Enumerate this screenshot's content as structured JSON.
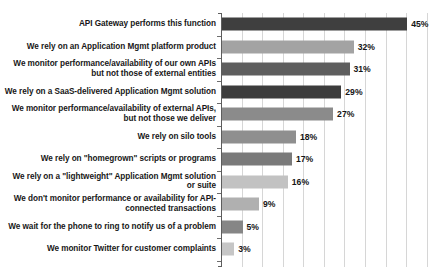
{
  "title_sliver": "",
  "chart_data": {
    "type": "bar",
    "orientation": "horizontal",
    "title": "",
    "xlabel": "",
    "ylabel": "",
    "xlim": [
      0,
      52
    ],
    "grid": true,
    "gridline_step": 5,
    "legend": "none",
    "value_suffix": "%",
    "categories": [
      "API Gateway performs this function",
      "We rely on an Application Mgmt platform product",
      "We monitor performance/availability of our own APIs but not those of external entities",
      "We rely on a  SaaS-delivered Application Mgmt solution",
      "We monitor performance/availability of external APIs, but not those we deliver",
      "We rely on silo tools",
      "We rely on \"homegrown\" scripts or programs",
      "We rely on a \"lightweight\" Application Mgmt solution or suite",
      "We don't monitor performance or availability for API-connected transactions",
      "We wait for the phone to ring to notify us of a problem",
      "We monitor Twitter for customer complaints"
    ],
    "values": [
      45,
      32,
      31,
      29,
      27,
      18,
      17,
      16,
      9,
      5,
      3
    ],
    "value_labels": [
      "45%",
      "32%",
      "31%",
      "29%",
      "27%",
      "18%",
      "17%",
      "16%",
      "9%",
      "5%",
      "3%"
    ],
    "bar_colors": [
      "#3f3f3f",
      "#a3a3a3",
      "#5e5e5e",
      "#3c3c3c",
      "#8b8b8b",
      "#8f8f8f",
      "#7a7a7a",
      "#c2c2c2",
      "#b0b0b0",
      "#868686",
      "#c6c6c6"
    ]
  }
}
